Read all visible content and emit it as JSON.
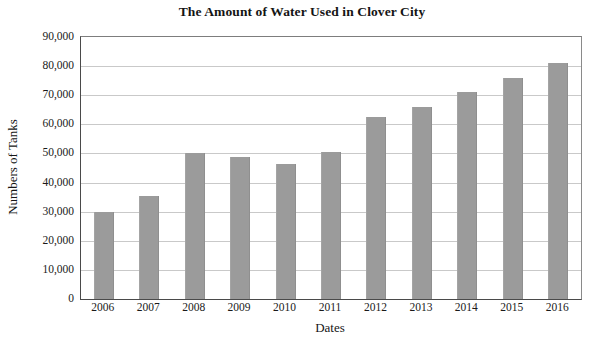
{
  "chart_data": {
    "type": "bar",
    "title": "The Amount of Water Used in Clover City",
    "xlabel": "Dates",
    "ylabel": "Numbers of Tanks",
    "categories": [
      "2006",
      "2007",
      "2008",
      "2009",
      "2010",
      "2011",
      "2012",
      "2013",
      "2014",
      "2015",
      "2016"
    ],
    "values": [
      30000,
      35500,
      50200,
      48800,
      46500,
      50500,
      62500,
      66000,
      71000,
      76000,
      81000
    ],
    "ylim": [
      0,
      90000
    ],
    "ytick_values": [
      0,
      10000,
      20000,
      30000,
      40000,
      50000,
      60000,
      70000,
      80000,
      90000
    ],
    "ytick_labels": [
      "0",
      "10,000",
      "20,000",
      "30,000",
      "40,000",
      "50,000",
      "60,000",
      "70,000",
      "80,000",
      "90,000"
    ],
    "grid": "horizontal",
    "legend": "none",
    "bar_color": "#9b9b9b",
    "background_color": "#ffffff",
    "axis_color": "#4a4a4a",
    "gridline_color": "#c9c9c9"
  }
}
